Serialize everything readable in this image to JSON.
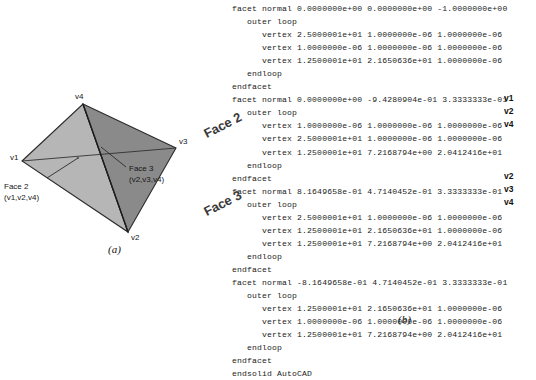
{
  "figure": {
    "subcaption_a": "(a)",
    "subcaption_b": "(b)",
    "diagram": {
      "name": "tetrahedron-wireframe",
      "vertex_labels": [
        {
          "id": "v1",
          "label": "v1",
          "x": 10,
          "y": 157
        },
        {
          "id": "v2",
          "label": "v2",
          "x": 130,
          "y": 238
        },
        {
          "id": "v3",
          "label": "v3",
          "x": 179,
          "y": 141
        },
        {
          "id": "v4",
          "label": "v4",
          "x": 75,
          "y": 96
        }
      ],
      "callouts": [
        {
          "name": "face-2-callout",
          "title": "Face 2",
          "vertices": "(v1,v2,v4)",
          "x": 4,
          "y": 181
        },
        {
          "name": "face-3-callout",
          "title": "Face 3",
          "vertices": "(v2,v3,v4)",
          "x": 129,
          "y": 164
        }
      ],
      "colors": {
        "face_left": "#b6b6b6",
        "face_right": "#8a8a8a",
        "outline": "#2b2b2b"
      }
    }
  },
  "listing": {
    "name": "stl-ascii-listing",
    "language": "stl-ascii",
    "text": "facet normal 0.0000000e+00 0.0000000e+00 -1.0000000e+00\n   outer loop\n      vertex 2.5000001e+01 1.0000000e-06 1.0000000e-06\n      vertex 1.0000000e-06 1.0000000e-06 1.0000000e-06\n      vertex 1.2500001e+01 2.1650636e+01 1.0000000e-06\n   endloop\nendfacet\nfacet normal 0.0000000e+00 -9.4280904e-01 3.3333333e-01\n   outer loop\n      vertex 1.0000000e-06 1.0000000e-06 1.0000000e-06\n      vertex 2.5000001e+01 1.0000000e-06 1.0000000e-06\n      vertex 1.2500001e+01 7.2168794e+00 2.0412416e+01\n   endloop\nendfacet\nfacet normal 8.1649658e-01 4.7140452e-01 3.3333333e-01\n   outer loop\n      vertex 2.5000001e+01 1.0000000e-06 1.0000000e-06\n      vertex 1.2500001e+01 2.1650636e+01 1.0000000e-06\n      vertex 1.2500001e+01 7.2168794e+00 2.0412416e+01\n   endloop\nendfacet\nfacet normal -8.1649658e-01 4.7140452e-01 3.3333333e-01\n   outer loop\n      vertex 1.2500001e+01 2.1650636e+01 1.0000000e-06\n      vertex 1.0000000e-06 1.0000000e-06 1.0000000e-06\n      vertex 1.2500001e+01 7.2168794e+00 2.0412416e+01\n   endloop\nendfacet\nendsolid AutoCAD",
    "vertex_tags": [
      {
        "label": "v1",
        "x": 288,
        "y": 98
      },
      {
        "label": "v2",
        "x": 288,
        "y": 111
      },
      {
        "label": "v4",
        "x": 288,
        "y": 124
      },
      {
        "label": "v2",
        "x": 288,
        "y": 176
      },
      {
        "label": "v3",
        "x": 288,
        "y": 189
      },
      {
        "label": "v4",
        "x": 288,
        "y": 202
      }
    ],
    "face_annotations": [
      {
        "label": "Face 2",
        "x": -18,
        "y": 124
      },
      {
        "label": "Face 3",
        "x": -18,
        "y": 202
      }
    ]
  }
}
